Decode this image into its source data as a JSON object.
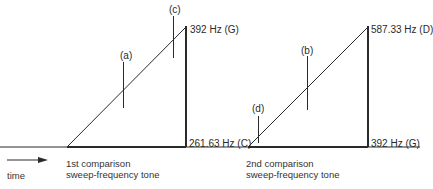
{
  "diagram": {
    "colors": {
      "line": "#2a2a2a",
      "background": "#ffffff"
    },
    "time_axis": {
      "label": "time",
      "icon": "arrow-right-icon"
    },
    "sweep1": {
      "caption_line1": "1st comparison",
      "caption_line2": "sweep-frequency tone",
      "top_label": "392 Hz (G)",
      "bottom_label": "261.63 Hz (C)",
      "markers": [
        {
          "label": "(a)"
        },
        {
          "label": "(c)"
        }
      ]
    },
    "sweep2": {
      "caption_line1": "2nd comparison",
      "caption_line2": "sweep-frequency tone",
      "top_label": "587.33 Hz (D)",
      "bottom_label": "392 Hz  (G)",
      "markers": [
        {
          "label": "(b)"
        },
        {
          "label": "(d)"
        }
      ]
    }
  }
}
